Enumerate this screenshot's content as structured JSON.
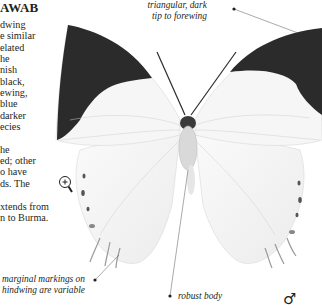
{
  "heading": {
    "title_fragment": "AWAB"
  },
  "description": {
    "lines": [
      "dwing",
      "e similar",
      "elated",
      "he",
      "nish",
      "black,",
      "ewing,",
      "blue",
      "darker",
      "ecies",
      "",
      "he",
      "ed; other",
      "o have",
      "ds. The",
      "",
      "xtends from",
      "n to Burma."
    ]
  },
  "annotations": {
    "forewing_tip": [
      "triangular, dark",
      "tip to forewing"
    ],
    "hindwing_markings": [
      "marginal markings on",
      "hindwing are variable"
    ],
    "body": "robust body"
  },
  "icons": {
    "magnifier": "magnifier-plus-icon",
    "sex_symbol": "♂"
  },
  "colors": {
    "text": "#231f20",
    "wing_dark": "#2b2b2b",
    "wing_light": "#f4f4f4",
    "leader_line": "#555555"
  }
}
